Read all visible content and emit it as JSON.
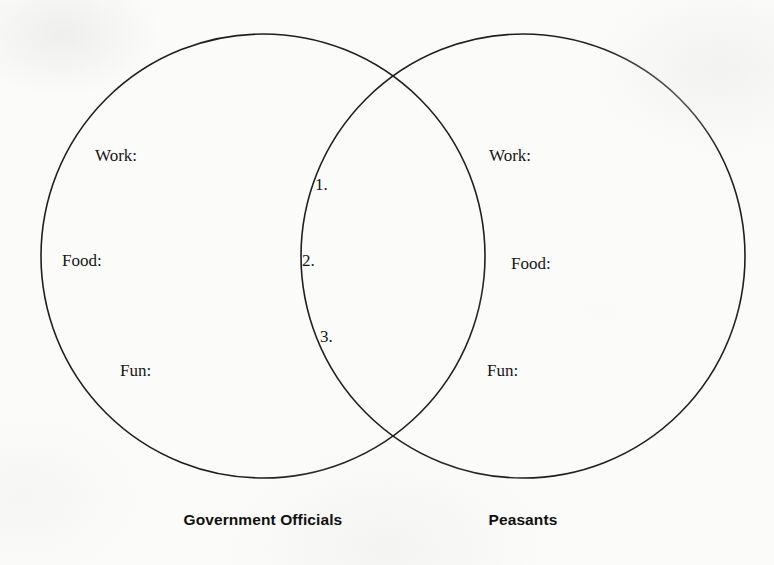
{
  "worksheet": {
    "background_color": "#fbfbfa",
    "stroke_color": "#1f1f1f"
  },
  "diagram": {
    "type": "venn-two-set",
    "left_circle": {
      "cx": 263,
      "cy": 256,
      "r": 222
    },
    "right_circle": {
      "cx": 523,
      "cy": 256,
      "r": 222
    }
  },
  "left_set": {
    "caption": "Government Officials",
    "prompts": [
      {
        "label": "Work:",
        "x": 95,
        "y": 147
      },
      {
        "label": "Food:",
        "x": 62,
        "y": 252
      },
      {
        "label": "Fun:",
        "x": 120,
        "y": 362
      }
    ]
  },
  "right_set": {
    "caption": "Peasants",
    "prompts": [
      {
        "label": "Work:",
        "x": 489,
        "y": 147
      },
      {
        "label": "Food:",
        "x": 511,
        "y": 255
      },
      {
        "label": "Fun:",
        "x": 487,
        "y": 362
      }
    ]
  },
  "overlap": {
    "items": [
      {
        "label": "1.",
        "x": 315,
        "y": 176
      },
      {
        "label": "2.",
        "x": 302,
        "y": 252
      },
      {
        "label": "3.",
        "x": 320,
        "y": 328
      }
    ]
  }
}
